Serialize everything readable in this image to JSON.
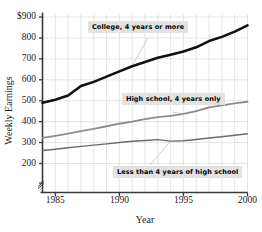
{
  "chart_data": {
    "type": "line",
    "title": "",
    "xlabel": "Year",
    "ylabel": "Weekly Earnings",
    "xlim": [
      1984,
      2000
    ],
    "ylim": [
      150,
      900
    ],
    "ylim_note": "axis broken below 200",
    "grid": true,
    "legend_position": "inline-annotations",
    "y_ticks": [
      "$900",
      "800",
      "700",
      "600",
      "500",
      "400",
      "300",
      "200"
    ],
    "y_tick_values": [
      900,
      800,
      700,
      600,
      500,
      400,
      300,
      200
    ],
    "x_ticks": [
      "1985",
      "1990",
      "1995",
      "2000"
    ],
    "x_tick_values": [
      1985,
      1990,
      1995,
      2000
    ],
    "x": [
      1984,
      1985,
      1986,
      1987,
      1988,
      1989,
      1990,
      1991,
      1992,
      1993,
      1994,
      1995,
      1996,
      1997,
      1998,
      1999,
      2000
    ],
    "series": [
      {
        "name": "College, 4 years or more",
        "color": "#111111",
        "width": 2.6,
        "values": [
          490,
          505,
          525,
          570,
          590,
          615,
          640,
          665,
          685,
          705,
          720,
          735,
          755,
          785,
          805,
          830,
          860
        ]
      },
      {
        "name": "High school, 4 years only",
        "color": "#8c8c8c",
        "width": 1.8,
        "values": [
          322,
          332,
          343,
          355,
          365,
          378,
          390,
          400,
          412,
          422,
          428,
          437,
          450,
          468,
          478,
          487,
          495
        ]
      },
      {
        "name": "Less than 4 years of high school",
        "color": "#6b6b6b",
        "width": 1.4,
        "values": [
          262,
          268,
          275,
          282,
          288,
          294,
          300,
          306,
          310,
          314,
          307,
          309,
          315,
          322,
          328,
          335,
          342
        ]
      }
    ],
    "annotations": [
      {
        "label": "College, 4 years or more",
        "target_year": 1991,
        "target_value": 668
      },
      {
        "label": "High school, 4 years only",
        "target_year": 1995,
        "target_value": 437
      },
      {
        "label": "Less than 4 years of high school",
        "target_year": 1994,
        "target_value": 308
      }
    ]
  },
  "axis": {
    "y_title": "Weekly Earnings",
    "x_title": "Year"
  },
  "colors": {
    "college": "#111111",
    "high_school": "#8c8c8c",
    "less_than_hs": "#6b6b6b",
    "grid": "#d8d8d8",
    "axis": "#3a3a3a",
    "callout_bg": "#e2e2e2"
  }
}
